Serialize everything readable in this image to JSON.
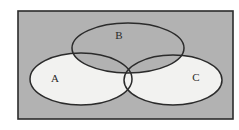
{
  "figure": {
    "kind": "venn-diagram",
    "title": "",
    "canvas": {
      "width": 239,
      "height": 130
    },
    "page_background": "#ffffff"
  },
  "universal_set": {
    "name": "universal-set-rectangle",
    "label": "",
    "fill": "#b2b2b2",
    "stroke": "#2b2b2b",
    "stroke_width": 1.6,
    "x": 18,
    "y": 11,
    "width": 215,
    "height": 108
  },
  "sets": [
    {
      "id": "A",
      "label": "A",
      "name": "ellipse-a",
      "position": "left",
      "fill": "#f2f2f0",
      "filled": true,
      "stroke": "#2b2b2b",
      "stroke_width": 1.5,
      "cx": 81,
      "cy": 79,
      "rx": 51,
      "ry": 26,
      "label_x": 55,
      "label_y": 79
    },
    {
      "id": "B",
      "label": "B",
      "name": "ellipse-b",
      "position": "top",
      "fill": "none",
      "filled": false,
      "stroke": "#2b2b2b",
      "stroke_width": 1.5,
      "cx": 128,
      "cy": 48,
      "rx": 56,
      "ry": 25,
      "label_x": 119,
      "label_y": 36
    },
    {
      "id": "C",
      "label": "C",
      "name": "ellipse-c",
      "position": "right",
      "fill": "#f2f2f0",
      "filled": true,
      "stroke": "#2b2b2b",
      "stroke_width": 1.5,
      "cx": 173,
      "cy": 80,
      "rx": 49,
      "ry": 25,
      "label_x": 196,
      "label_y": 78
    }
  ],
  "regions": {
    "outside_all": "#b2b2b2",
    "a_only": "#f2f2f0",
    "b_only": "#b2b2b2",
    "c_only": "#f2f2f0",
    "a_and_b": "#b2b2b2",
    "b_and_c": "#b2b2b2",
    "a_and_c": "#f2f2f0",
    "a_and_b_and_c": "#b2b2b2"
  }
}
